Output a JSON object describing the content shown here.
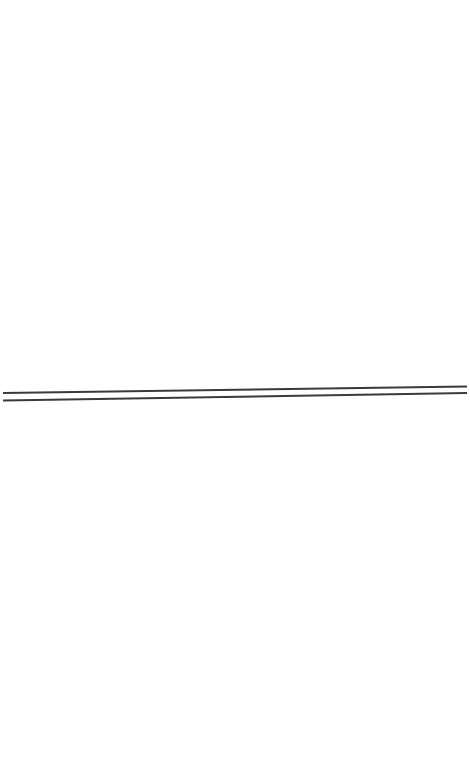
{
  "canvas": {
    "width": 470,
    "height": 763,
    "background": "#ffffff"
  },
  "lines": [
    {
      "name": "upper-line",
      "x1": 3,
      "y1": 393,
      "x2": 467,
      "y2": 386.5,
      "stroke": "#3a3a3a",
      "stroke_width": 2
    },
    {
      "name": "lower-line",
      "x1": 3,
      "y1": 400.5,
      "x2": 467,
      "y2": 393,
      "stroke": "#3a3a3a",
      "stroke_width": 2
    }
  ]
}
